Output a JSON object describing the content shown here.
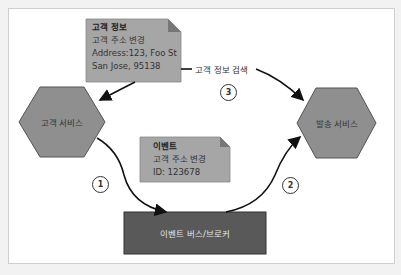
{
  "diagram": {
    "nodes": {
      "customer_service": {
        "label": "고객 서비스",
        "shape": "hexagon",
        "color": "#8f8f8f"
      },
      "shipping_service": {
        "label": "발송 서비스",
        "shape": "hexagon",
        "color": "#8f8f8f"
      },
      "event_bus": {
        "label": "이벤트 버스/브로커",
        "shape": "rectangle",
        "color": "#595959"
      }
    },
    "notes": {
      "customer_info": {
        "title": "고객 정보",
        "line1": "고객 주소 변경",
        "line2": "Address:123, Foo St",
        "line3": "San Jose, 95138",
        "color": "#a6a6a6"
      },
      "event": {
        "title": "이벤트",
        "line1": "고객 주소 변경",
        "line2": "ID: 123678",
        "color": "#a6a6a6"
      }
    },
    "edges": {
      "lookup_label": "고객 정보 검색"
    },
    "steps": [
      "1",
      "2",
      "3"
    ]
  }
}
